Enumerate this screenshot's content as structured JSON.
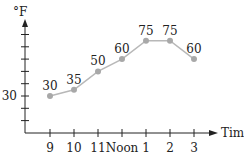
{
  "chart_data": {
    "type": "line",
    "title": "",
    "xlabel": "Time",
    "ylabel": "°F",
    "categories": [
      "9",
      "10",
      "11",
      "Noon",
      "1",
      "2",
      "3"
    ],
    "series": [
      {
        "name": "Temperature",
        "values": [
          30,
          35,
          50,
          60,
          75,
          75,
          60
        ]
      }
    ],
    "data_labels": [
      "30",
      "35",
      "50",
      "60",
      "75",
      "75",
      "60"
    ],
    "y_tick_labels": [
      "30"
    ],
    "y_tick_values": [
      10,
      20,
      30,
      40,
      50,
      60,
      70,
      80
    ],
    "ylim": [
      0,
      85
    ],
    "grid": false,
    "legend": "none"
  },
  "colors": {
    "axis": "#222222",
    "line": "#b8b8b8",
    "marker": "#a8a8a8",
    "text": "#222222"
  }
}
